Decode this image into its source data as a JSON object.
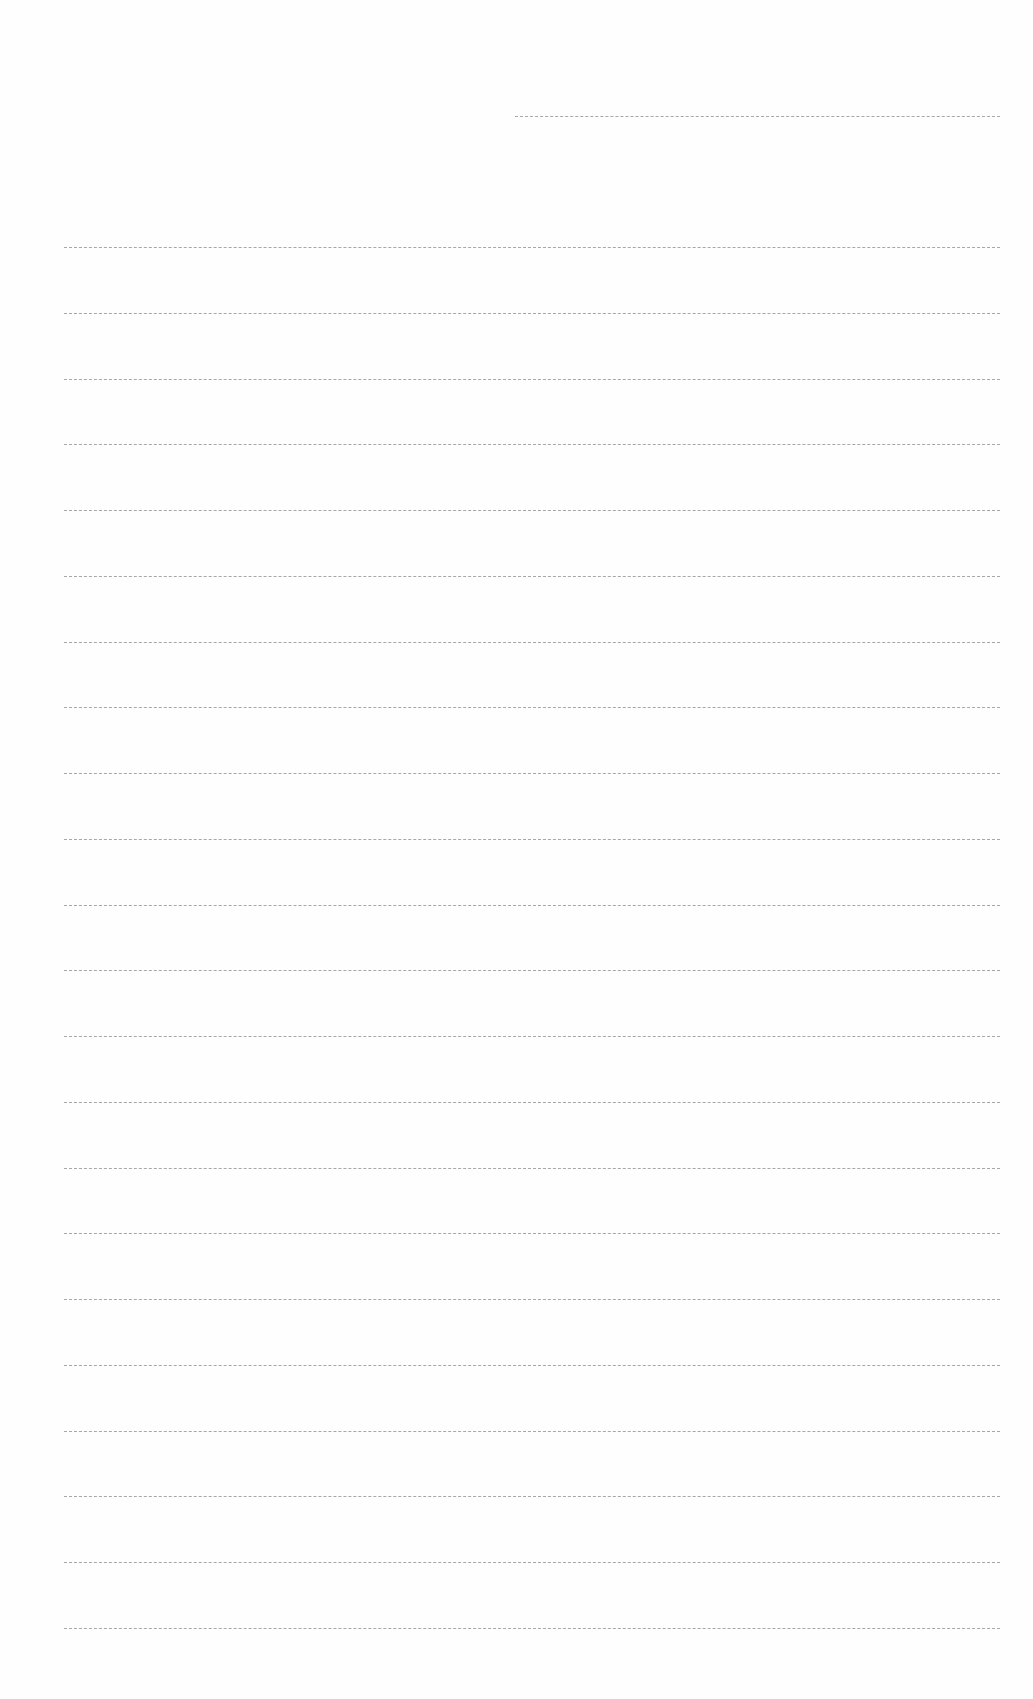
{
  "document": {
    "type": "ruled-blank-page",
    "header_line": {
      "present": true,
      "text": ""
    },
    "line_count": 22,
    "lines": [
      "",
      "",
      "",
      "",
      "",
      "",
      "",
      "",
      "",
      "",
      "",
      "",
      "",
      "",
      "",
      "",
      "",
      "",
      "",
      "",
      "",
      ""
    ]
  },
  "colors": {
    "paper": "#fefefe",
    "rule": "#8a8a8a"
  }
}
